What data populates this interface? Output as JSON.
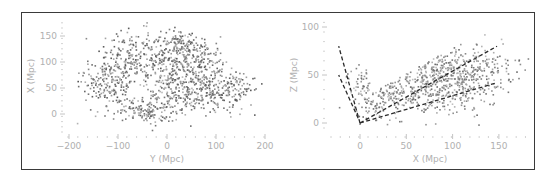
{
  "chart_data": [
    {
      "type": "scatter",
      "panel": "left",
      "title": "",
      "xlabel": "Y (Mpc)",
      "ylabel": "X (Mpc)",
      "xlim": [
        -200,
        200
      ],
      "ylim": [
        -25,
        180
      ],
      "xticks": [
        -200,
        -100,
        0,
        100,
        200
      ],
      "xtick_labels": [
        "−200",
        "−100",
        "0",
        "100",
        "200"
      ],
      "yticks": [
        0,
        50,
        100,
        150
      ],
      "ytick_labels": [
        "0",
        "50",
        "100",
        "150"
      ],
      "grid": false,
      "legend": null,
      "marker_color_range": [
        "#555555",
        "#bbbbbb"
      ],
      "clusters": [
        {
          "cx": -120,
          "cy": 70,
          "sx": 30,
          "sy": 30,
          "n": 220
        },
        {
          "cx": -60,
          "cy": 110,
          "sx": 35,
          "sy": 25,
          "n": 180
        },
        {
          "cx": -50,
          "cy": 5,
          "sx": 25,
          "sy": 10,
          "n": 110
        },
        {
          "cx": 10,
          "cy": 95,
          "sx": 30,
          "sy": 30,
          "n": 220
        },
        {
          "cx": 25,
          "cy": 135,
          "sx": 15,
          "sy": 15,
          "n": 70
        },
        {
          "cx": 70,
          "cy": 90,
          "sx": 25,
          "sy": 30,
          "n": 180
        },
        {
          "cx": 90,
          "cy": 45,
          "sx": 35,
          "sy": 15,
          "n": 150
        },
        {
          "cx": 10,
          "cy": 30,
          "sx": 35,
          "sy": 20,
          "n": 140
        },
        {
          "cx": 140,
          "cy": 50,
          "sx": 20,
          "sy": 25,
          "n": 60
        }
      ]
    },
    {
      "type": "scatter",
      "panel": "right",
      "title": "",
      "xlabel": "X (Mpc)",
      "ylabel": "Z (Mpc)",
      "xlim": [
        -30,
        180
      ],
      "ylim": [
        -15,
        105
      ],
      "xticks": [
        0,
        50,
        100,
        150
      ],
      "xtick_labels": [
        "0",
        "50",
        "100",
        "150"
      ],
      "yticks": [
        0,
        50,
        100
      ],
      "ytick_labels": [
        "0",
        "50",
        "100"
      ],
      "grid": false,
      "legend": null,
      "marker_color_range": [
        "#666666",
        "#c0c0c0"
      ],
      "wedge_lines": [
        {
          "x": [
            0,
            -23
          ],
          "y": [
            0,
            80
          ],
          "style": "dashed"
        },
        {
          "x": [
            -2,
            -23
          ],
          "y": [
            5,
            50
          ],
          "style": "dashed"
        },
        {
          "x": [
            0,
            148
          ],
          "y": [
            0,
            80
          ],
          "style": "dashed"
        },
        {
          "x": [
            0,
            148
          ],
          "y": [
            0,
            42
          ],
          "style": "dashed"
        }
      ],
      "clusters": [
        {
          "cx": 60,
          "cy": 45,
          "sx": 35,
          "sy": 18,
          "n": 420
        },
        {
          "cx": 100,
          "cy": 45,
          "sx": 25,
          "sy": 15,
          "n": 320
        },
        {
          "cx": 20,
          "cy": 30,
          "sx": 15,
          "sy": 15,
          "n": 160
        },
        {
          "cx": 140,
          "cy": 60,
          "sx": 18,
          "sy": 12,
          "n": 80
        },
        {
          "cx": 60,
          "cy": 70,
          "sx": 25,
          "sy": 8,
          "n": 90
        }
      ]
    }
  ]
}
